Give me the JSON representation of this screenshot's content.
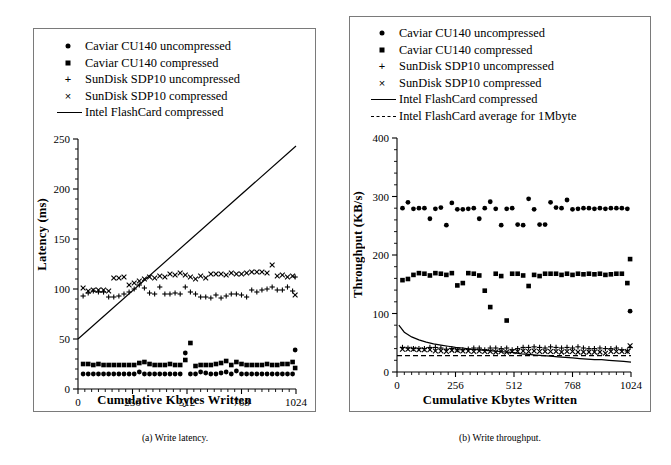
{
  "figure": {
    "captions": [
      {
        "id": "a",
        "text": "(a) Write latency."
      },
      {
        "id": "b",
        "text": "(b) Write throughput."
      }
    ]
  },
  "panel_a": {
    "legend": [
      {
        "marker": "dot-marker",
        "label": "Caviar CU140 uncompressed"
      },
      {
        "marker": "square-marker",
        "label": "Caviar CU140 compressed"
      },
      {
        "marker": "plus-marker",
        "label": "SunDisk SDP10 uncompressed"
      },
      {
        "marker": "cross-marker",
        "label": "SunDisk SDP10 compressed"
      },
      {
        "marker": "solid-line",
        "label": "Intel FlashCard compressed"
      }
    ]
  },
  "panel_b": {
    "legend": [
      {
        "marker": "dot-marker",
        "label": "Caviar CU140 uncompressed"
      },
      {
        "marker": "square-marker",
        "label": "Caviar CU140 compressed"
      },
      {
        "marker": "plus-marker",
        "label": "SunDisk SDP10 uncompressed"
      },
      {
        "marker": "cross-marker",
        "label": "SunDisk SDP10 compressed"
      },
      {
        "marker": "solid-line",
        "label": "Intel FlashCard compressed"
      },
      {
        "marker": "dashed-line",
        "label": "Intel FlashCard average for 1Mbyte"
      }
    ]
  },
  "chart_data": [
    {
      "id": "write-latency",
      "type": "scatter",
      "title": "(a) Write latency.",
      "xlabel": "Cumulative Kbytes Written",
      "ylabel": "Latency (ms)",
      "xlim": [
        0,
        1024
      ],
      "ylim": [
        0,
        250
      ],
      "xticks": [
        0,
        256,
        512,
        768,
        1024
      ],
      "yticks": [
        0,
        50,
        100,
        150,
        200,
        250
      ],
      "xtick_labels": [
        "0",
        "256",
        "512",
        "768",
        "1024"
      ],
      "ytick_labels": [
        "0",
        "50",
        "100",
        "150",
        "200",
        "250"
      ],
      "grid": false,
      "minor_ticks": true,
      "legend_position": "above-plot",
      "series": [
        {
          "name": "Caviar CU140 uncompressed",
          "marker": "dot",
          "x": [
            24,
            48,
            72,
            96,
            120,
            144,
            168,
            192,
            216,
            240,
            264,
            288,
            312,
            336,
            360,
            384,
            408,
            432,
            456,
            480,
            504,
            528,
            552,
            576,
            600,
            624,
            648,
            672,
            696,
            720,
            744,
            768,
            792,
            816,
            840,
            864,
            888,
            912,
            936,
            960,
            984,
            1008,
            1020
          ],
          "y": [
            15,
            15,
            15,
            15,
            15,
            15,
            15,
            15,
            15,
            15,
            15,
            17,
            15,
            15,
            15,
            15,
            15,
            15,
            15,
            15,
            36,
            15,
            15,
            17,
            16,
            15,
            15,
            16,
            17,
            15,
            18,
            15,
            15,
            15,
            15,
            15,
            15,
            15,
            15,
            15,
            15,
            15,
            39
          ]
        },
        {
          "name": "Caviar CU140 compressed",
          "marker": "square",
          "x": [
            24,
            48,
            72,
            96,
            120,
            144,
            168,
            192,
            216,
            240,
            264,
            288,
            312,
            336,
            360,
            384,
            408,
            432,
            456,
            480,
            504,
            528,
            552,
            576,
            600,
            624,
            648,
            672,
            696,
            720,
            744,
            768,
            792,
            816,
            840,
            864,
            888,
            912,
            936,
            960,
            984,
            1008,
            1020
          ],
          "y": [
            25,
            25,
            24,
            25,
            24,
            24,
            24,
            24,
            24,
            24,
            24,
            26,
            27,
            25,
            24,
            24,
            24,
            25,
            24,
            24,
            29,
            46,
            23,
            24,
            24,
            24,
            25,
            26,
            28,
            24,
            27,
            25,
            24,
            24,
            24,
            24,
            25,
            24,
            24,
            25,
            25,
            27,
            21
          ]
        },
        {
          "name": "SunDisk SDP10 uncompressed",
          "marker": "plus",
          "x": [
            24,
            48,
            72,
            96,
            120,
            144,
            168,
            192,
            216,
            240,
            264,
            288,
            312,
            336,
            360,
            384,
            408,
            432,
            456,
            480,
            504,
            528,
            552,
            576,
            600,
            624,
            648,
            672,
            696,
            720,
            744,
            768,
            792,
            816,
            840,
            864,
            888,
            912,
            936,
            960,
            984,
            1008,
            1020
          ],
          "y": [
            93,
            96,
            98,
            97,
            97,
            92,
            92,
            93,
            95,
            97,
            100,
            104,
            101,
            96,
            95,
            102,
            95,
            95,
            96,
            95,
            102,
            97,
            95,
            92,
            92,
            91,
            94,
            91,
            93,
            95,
            95,
            94,
            92,
            99,
            97,
            99,
            100,
            102,
            99,
            99,
            102,
            98,
            112
          ]
        },
        {
          "name": "SunDisk SDP10 compressed",
          "marker": "cross",
          "x": [
            24,
            48,
            72,
            96,
            120,
            144,
            168,
            192,
            216,
            240,
            264,
            288,
            312,
            336,
            360,
            384,
            408,
            432,
            456,
            480,
            504,
            528,
            552,
            576,
            600,
            624,
            648,
            672,
            696,
            720,
            744,
            768,
            792,
            816,
            840,
            864,
            888,
            912,
            936,
            960,
            984,
            1008,
            1020
          ],
          "y": [
            101,
            98,
            99,
            99,
            99,
            98,
            111,
            111,
            112,
            104,
            106,
            108,
            110,
            112,
            111,
            113,
            112,
            115,
            114,
            116,
            114,
            112,
            110,
            113,
            111,
            115,
            115,
            115,
            114,
            116,
            115,
            115,
            116,
            117,
            117,
            117,
            116,
            124,
            113,
            114,
            112,
            113,
            94
          ]
        },
        {
          "name": "Intel FlashCard compressed",
          "marker": "line",
          "x": [
            0,
            1024
          ],
          "y": [
            50,
            243
          ]
        }
      ]
    },
    {
      "id": "write-throughput",
      "type": "scatter",
      "title": "(b) Write throughput.",
      "xlabel": "Cumulative Kbytes Written",
      "ylabel": "Throughput (KB/s)",
      "xlim": [
        0,
        1024
      ],
      "ylim": [
        0,
        400
      ],
      "xticks": [
        0,
        256,
        512,
        768,
        1024
      ],
      "yticks": [
        0,
        100,
        200,
        300,
        400
      ],
      "xtick_labels": [
        "0",
        "256",
        "512",
        "768",
        "1024"
      ],
      "ytick_labels": [
        "0",
        "100",
        "200",
        "300",
        "400"
      ],
      "grid": false,
      "minor_ticks": true,
      "legend_position": "above-plot",
      "series": [
        {
          "name": "Caviar CU140 uncompressed",
          "marker": "dot",
          "x": [
            24,
            48,
            72,
            96,
            120,
            144,
            168,
            192,
            216,
            240,
            264,
            288,
            312,
            336,
            360,
            384,
            408,
            432,
            456,
            480,
            504,
            528,
            552,
            576,
            600,
            624,
            648,
            672,
            696,
            720,
            744,
            768,
            792,
            816,
            840,
            864,
            888,
            912,
            936,
            960,
            984,
            1008,
            1020
          ],
          "y": [
            280,
            290,
            279,
            280,
            280,
            262,
            279,
            281,
            251,
            289,
            278,
            278,
            279,
            280,
            262,
            280,
            291,
            279,
            251,
            279,
            280,
            252,
            251,
            296,
            278,
            252,
            252,
            290,
            281,
            280,
            294,
            278,
            279,
            280,
            280,
            279,
            280,
            279,
            280,
            280,
            280,
            279,
            104
          ]
        },
        {
          "name": "Caviar CU140 compressed",
          "marker": "square",
          "x": [
            24,
            48,
            72,
            96,
            120,
            144,
            168,
            192,
            216,
            240,
            264,
            288,
            312,
            336,
            360,
            384,
            408,
            432,
            456,
            480,
            504,
            528,
            552,
            576,
            600,
            624,
            648,
            672,
            696,
            720,
            744,
            768,
            792,
            816,
            840,
            864,
            888,
            912,
            936,
            960,
            984,
            1008,
            1020
          ],
          "y": [
            157,
            159,
            166,
            169,
            168,
            165,
            169,
            168,
            166,
            169,
            148,
            152,
            169,
            168,
            165,
            139,
            111,
            168,
            164,
            88,
            168,
            168,
            165,
            147,
            166,
            164,
            168,
            168,
            168,
            166,
            168,
            166,
            168,
            167,
            168,
            167,
            168,
            166,
            167,
            168,
            168,
            152,
            193
          ]
        },
        {
          "name": "SunDisk SDP10 uncompressed",
          "marker": "plus",
          "x": [
            24,
            48,
            72,
            96,
            120,
            144,
            168,
            192,
            216,
            240,
            264,
            288,
            312,
            336,
            360,
            384,
            408,
            432,
            456,
            480,
            504,
            528,
            552,
            576,
            600,
            624,
            648,
            672,
            696,
            720,
            744,
            768,
            792,
            816,
            840,
            864,
            888,
            912,
            936,
            960,
            984,
            1008,
            1020
          ],
          "y": [
            42,
            41,
            40,
            40,
            40,
            42,
            42,
            41,
            39,
            40,
            38,
            38,
            39,
            41,
            41,
            38,
            41,
            41,
            40,
            41,
            38,
            40,
            42,
            42,
            43,
            42,
            41,
            43,
            42,
            41,
            42,
            41,
            43,
            41,
            40,
            40,
            41,
            40,
            40,
            41,
            38,
            36,
            42
          ]
        },
        {
          "name": "SunDisk SDP10 compressed",
          "marker": "cross",
          "x": [
            24,
            48,
            72,
            96,
            120,
            144,
            168,
            192,
            216,
            240,
            264,
            288,
            312,
            336,
            360,
            384,
            408,
            432,
            456,
            480,
            504,
            528,
            552,
            576,
            600,
            624,
            648,
            672,
            696,
            720,
            744,
            768,
            792,
            816,
            840,
            864,
            888,
            912,
            936,
            960,
            984,
            1008,
            1020
          ],
          "y": [
            39,
            39,
            39,
            38,
            38,
            38,
            36,
            36,
            35,
            37,
            37,
            36,
            36,
            35,
            36,
            35,
            35,
            34,
            35,
            34,
            35,
            35,
            36,
            35,
            36,
            35,
            35,
            35,
            35,
            34,
            35,
            35,
            34,
            34,
            34,
            34,
            34,
            32,
            35,
            35,
            35,
            35,
            45
          ]
        },
        {
          "name": "Intel FlashCard compressed",
          "marker": "line",
          "x": [
            8,
            32,
            64,
            96,
            128,
            160,
            192,
            224,
            256,
            288,
            320,
            352,
            384,
            416,
            448,
            480,
            512,
            544,
            576,
            608,
            640,
            672,
            704,
            736,
            768,
            800,
            832,
            864,
            896,
            928,
            960,
            992,
            1024
          ],
          "y": [
            80,
            68,
            60,
            55,
            51,
            48,
            46,
            44,
            42,
            41,
            39,
            38,
            37,
            36,
            35,
            34,
            33,
            31,
            30,
            29,
            28,
            27,
            26,
            25,
            24,
            23,
            22,
            21,
            21,
            20,
            19,
            18,
            17
          ]
        },
        {
          "name": "Intel FlashCard average for 1Mbyte",
          "marker": "dashed-line",
          "x": [
            0,
            1024
          ],
          "y": [
            28,
            28
          ]
        }
      ]
    }
  ]
}
